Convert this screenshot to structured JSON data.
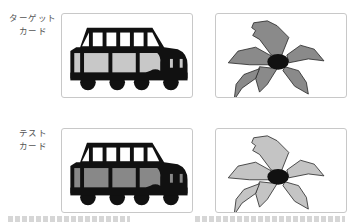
{
  "rows": [
    {
      "label_line1": "ターゲット",
      "label_line2": "カード",
      "car": {
        "window_fill": "#c8c8c8",
        "body_color": "#111111"
      },
      "flower": {
        "petal_fill": "#8a8a8a",
        "center_fill": "#111111"
      }
    },
    {
      "label_line1": "テスト",
      "label_line2": "カード",
      "car": {
        "window_fill": "#888888",
        "body_color": "#111111"
      },
      "flower": {
        "petal_fill": "#c4c4c4",
        "center_fill": "#111111"
      }
    }
  ],
  "colors": {
    "card_border": "#c8c8c8",
    "label_text": "#555555",
    "background": "#ffffff"
  }
}
